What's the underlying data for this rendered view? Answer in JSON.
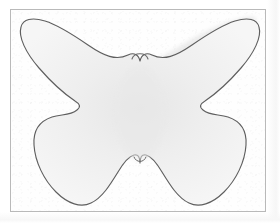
{
  "document": {
    "kind": "scanned-drawing",
    "title": "Butterfly template outline",
    "page_background": "#ffffff",
    "paper_background": "#fefefe",
    "frame_border_color": "#b9b9b9",
    "outline_color": "#5a5a5a",
    "shape_fill_color": "#f2f2f2",
    "shape_shadow_color": "#e3e3e3"
  },
  "frame": {
    "name": "paper-frame",
    "x": 10,
    "y": 9,
    "width": 256,
    "height": 203,
    "stroke_width": 1
  },
  "shape": {
    "name": "butterfly-outline",
    "description": "Four-lobed butterfly silhouette with a rounded head notch at top center and a small V notch at bottom center",
    "lobes": [
      {
        "name": "upper-left-wing",
        "tip_x": 24,
        "tip_y": 46
      },
      {
        "name": "upper-right-wing",
        "tip_x": 252,
        "tip_y": 46
      },
      {
        "name": "lower-left-wing",
        "tip_x": 46,
        "tip_y": 186
      },
      {
        "name": "lower-right-wing",
        "tip_x": 236,
        "tip_y": 184
      }
    ],
    "notches": [
      {
        "name": "top-center-head-notch",
        "x": 140,
        "y": 63
      },
      {
        "name": "bottom-center-notch",
        "x": 140,
        "y": 164
      },
      {
        "name": "left-side-notch",
        "x": 72,
        "y": 124
      },
      {
        "name": "right-side-notch",
        "x": 203,
        "y": 123
      }
    ],
    "path": "M 140 63 C 141 58 144 57 147 59 C 153 63 157 68 162 71 C 176 79 195 72 214 60 C 234 48 250 34 256 29 C 263 24 259 21 254 20 C 243 19 222 21 199 27 C 176 33 153 44 144 51 C 140 54 138 57 140 63 Z",
    "fill_opacity": 1
  },
  "layers": [
    {
      "name": "paper-grain-texture",
      "opacity": 0.5
    },
    {
      "name": "scan-edge-shadow-right",
      "opacity": 1
    },
    {
      "name": "scan-edge-shadow-bottom",
      "opacity": 1
    }
  ]
}
